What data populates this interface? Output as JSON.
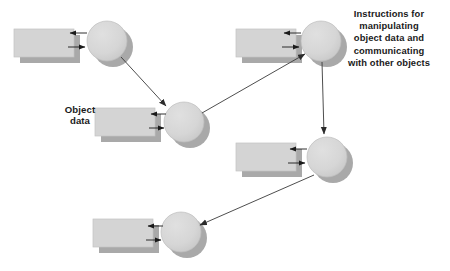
{
  "diagram": {
    "background_color": "#ffffff",
    "palette": {
      "shape_fill": "#d4d4d4",
      "shape_stroke": "#b4b4b4",
      "shadow_fill": "#a8a8a8",
      "arrow_color": "#1a1a1a",
      "link_arrow_color": "#4a4a4a",
      "text_color": "#1a1a1a"
    },
    "annotations": {
      "object_data": "Object\ndata",
      "instructions": "Instructions for\nmanipulating\nobject data and\ncommunicating\nwith other objects"
    },
    "instructions_lines": [
      "Instructions for",
      "manipulating",
      "object data and",
      "communicating",
      "with other objects"
    ],
    "object_data_lines": [
      "Object",
      "data"
    ],
    "objects": [
      {
        "id": "object-1",
        "name": "object-unit-top-left",
        "rect": {
          "x": 14,
          "y": 29,
          "width": 60,
          "height": 28
        },
        "circle": {
          "cx": 107,
          "cy": 41,
          "r": 20
        }
      },
      {
        "id": "object-2",
        "name": "object-unit-middle-left",
        "rect": {
          "x": 95,
          "y": 108,
          "width": 60,
          "height": 28
        },
        "circle": {
          "cx": 184,
          "cy": 122,
          "r": 20
        }
      },
      {
        "id": "object-3",
        "name": "object-unit-top-right",
        "rect": {
          "x": 236,
          "y": 29,
          "width": 60,
          "height": 28
        },
        "circle": {
          "cx": 321,
          "cy": 41,
          "r": 20
        }
      },
      {
        "id": "object-4",
        "name": "object-unit-middle-right",
        "rect": {
          "x": 236,
          "y": 143,
          "width": 60,
          "height": 28
        },
        "circle": {
          "cx": 327,
          "cy": 157,
          "r": 20
        }
      },
      {
        "id": "object-5",
        "name": "object-unit-bottom-left",
        "rect": {
          "x": 93,
          "y": 219,
          "width": 60,
          "height": 28
        },
        "circle": {
          "cx": 181,
          "cy": 232,
          "r": 20
        }
      }
    ],
    "links": [
      {
        "id": "link-1",
        "name": "link-top-left-to-middle-left",
        "from": "object-1",
        "to": "object-2",
        "x1": 121,
        "y1": 57,
        "x2": 167,
        "y2": 107,
        "direction": "down-right"
      },
      {
        "id": "link-2",
        "name": "link-middle-left-to-top-right",
        "from": "object-2",
        "to": "object-3",
        "x1": 201,
        "y1": 113,
        "x2": 306,
        "y2": 53,
        "direction": "up-right"
      },
      {
        "id": "link-3",
        "name": "link-top-right-to-middle-right",
        "from": "object-3",
        "to": "object-4",
        "x1": 322,
        "y1": 62,
        "x2": 325,
        "y2": 136,
        "direction": "down"
      },
      {
        "id": "link-4",
        "name": "link-middle-right-to-bottom-left",
        "from": "object-4",
        "to": "object-5",
        "x1": 313,
        "y1": 174,
        "x2": 199,
        "y2": 224,
        "direction": "down-left"
      }
    ]
  }
}
